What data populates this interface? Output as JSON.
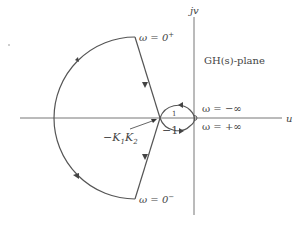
{
  "diagram": {
    "plane_label": "GH(s)-plane",
    "axes": {
      "horizontal_label": "u",
      "vertical_label": "jv"
    },
    "annotations": {
      "omega_zero_plus": "ω = 0",
      "omega_zero_plus_sup": "+",
      "omega_zero_minus": "ω = 0",
      "omega_zero_minus_sup": "−",
      "omega_neg_inf": "ω = −∞",
      "omega_pos_inf": "ω = +∞",
      "critical_point": "−1",
      "crossing_point_prefix": "−K",
      "crossing_point_sub1": "1",
      "crossing_point_mid": "K",
      "crossing_point_sub2": "2",
      "tick_label": "1"
    },
    "colors": {
      "curve": "#555555",
      "axes": "#666666",
      "text": "#444444"
    }
  }
}
